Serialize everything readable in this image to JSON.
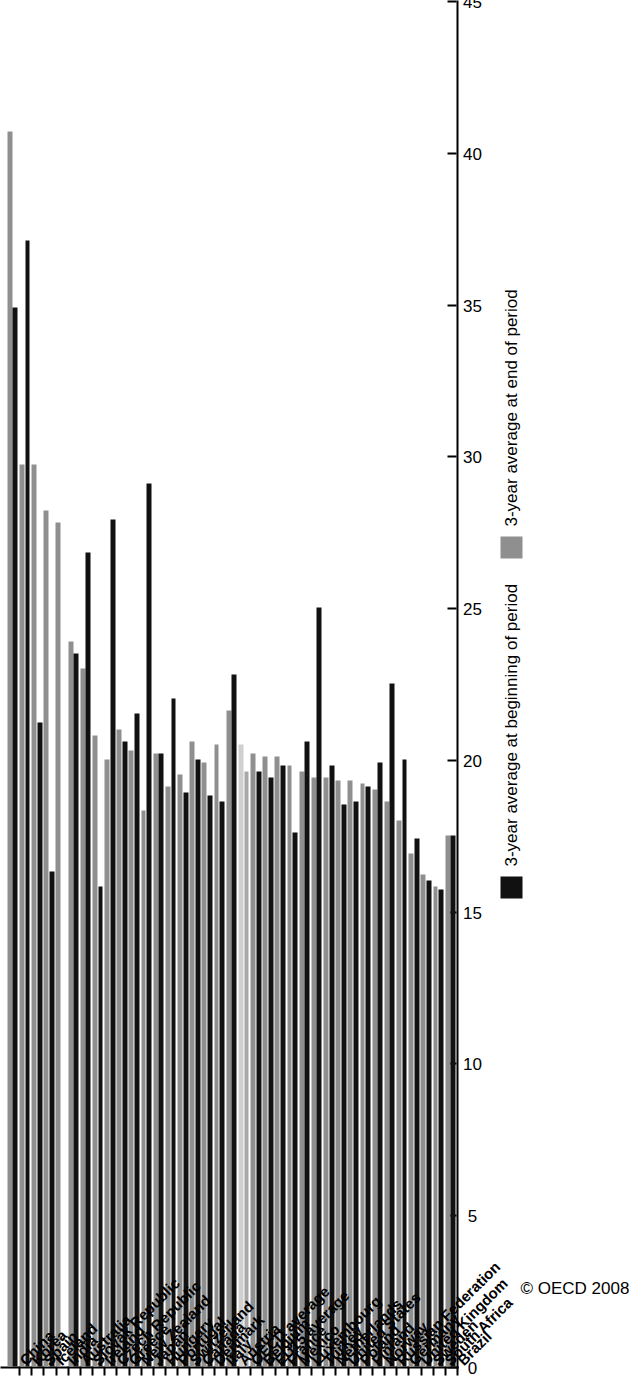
{
  "copyright": "© OECD 2008",
  "axis": {
    "ticks": [
      "0",
      "5",
      "10",
      "15",
      "20",
      "25",
      "30",
      "35",
      "40",
      "45"
    ],
    "min": 0,
    "max": 45,
    "step": 5
  },
  "legend": {
    "series": [
      {
        "label": "3-year average at beginning of period",
        "color": "#111111",
        "key": "begin"
      },
      {
        "label": "3-year average at end of period",
        "color": "#8f8f8f",
        "key": "end"
      }
    ]
  },
  "colors": {
    "begin": "#111111",
    "end": "#8f8f8f",
    "highlight_begin": "#a8a8a8",
    "highlight_end": "#d0d0d0",
    "axis": "#000000",
    "background": "#ffffff"
  },
  "chart_data": {
    "type": "bar",
    "orientation": "horizontal",
    "title": "",
    "subtitle": "",
    "xlabel": "",
    "ylabel": "",
    "ylim": [
      0,
      45
    ],
    "grid": false,
    "legend_position": "right",
    "categories": [
      "China",
      "Korea",
      "Spain",
      "Iceland",
      "India",
      "Australia",
      "Slovak Republic",
      "Ireland",
      "Czech Republic",
      "Greece",
      "New Zealand",
      "Japan",
      "Hungary",
      "Portugal",
      "Switzerland",
      "Canada",
      "Denmark",
      "Italy",
      "Austria",
      "OECD average",
      "Belgium",
      "EU15 average",
      "France",
      "Mexico",
      "Luxembourg",
      "Turkey",
      "Netherlands",
      "United States",
      "Poland",
      "Finland",
      "Norway",
      "Russian Federation",
      "Germany",
      "United Kingdom",
      "Sweden",
      "South Africa",
      "Brazil"
    ],
    "highlight_category": "OECD average",
    "series": [
      {
        "name": "3-year average at beginning of period",
        "key": "begin",
        "color": "#111111",
        "values": [
          34.9,
          37.1,
          21.2,
          16.3,
          0.0,
          23.5,
          26.8,
          15.8,
          27.9,
          20.6,
          21.5,
          29.1,
          20.2,
          22.0,
          18.9,
          20.0,
          18.8,
          18.6,
          22.8,
          19.6,
          19.6,
          19.4,
          19.8,
          17.6,
          20.6,
          25.0,
          19.8,
          18.5,
          18.6,
          19.1,
          19.9,
          22.5,
          20.0,
          17.4,
          16.0,
          15.7,
          17.5
        ]
      },
      {
        "name": "3-year average at end of period",
        "key": "end",
        "color": "#8f8f8f",
        "values": [
          40.7,
          29.7,
          29.7,
          28.2,
          27.8,
          23.9,
          23.0,
          20.8,
          20.0,
          21.0,
          20.3,
          18.3,
          20.2,
          19.1,
          19.5,
          20.6,
          19.9,
          20.5,
          21.6,
          20.5,
          20.2,
          20.1,
          20.1,
          19.8,
          19.6,
          19.4,
          19.4,
          19.3,
          19.3,
          19.2,
          19.0,
          18.6,
          18.0,
          16.9,
          16.2,
          15.8,
          17.5
        ]
      }
    ]
  }
}
